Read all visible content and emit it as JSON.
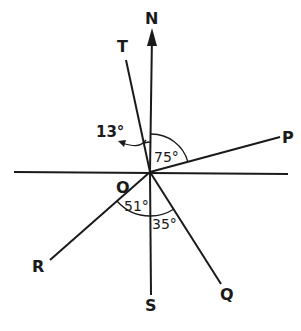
{
  "diagram": {
    "type": "bearing-diagram",
    "origin_label": "O",
    "direction_labels": {
      "north": "N",
      "south": "S",
      "T": "T",
      "P": "P",
      "Q": "Q",
      "R": "R"
    },
    "angles": {
      "NOT": "13°",
      "NOP": "75°",
      "ROS": "51°",
      "SOQ": "35°"
    },
    "colors": {
      "stroke": "#1a1a1a",
      "background": "#ffffff"
    }
  }
}
